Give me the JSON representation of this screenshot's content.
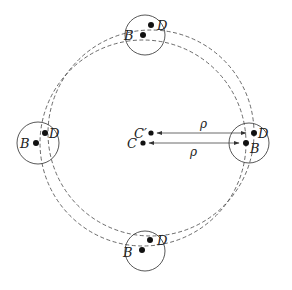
{
  "diagram": {
    "type": "geometric-orbit-diagram",
    "center_points": [
      {
        "id": "C",
        "label": "C",
        "x": 143,
        "y": 143
      },
      {
        "id": "Cprime",
        "label": "C′",
        "x": 151,
        "y": 133
      }
    ],
    "orbit_circles": [
      {
        "center": "C",
        "radius": 103,
        "style": "dashed"
      },
      {
        "center": "Cprime",
        "radius": 103,
        "style": "dashed"
      }
    ],
    "bodies": [
      {
        "position": "top",
        "circle": {
          "cx": 145,
          "cy": 35,
          "r": 20
        },
        "B": {
          "label": "B",
          "x": 143,
          "y": 35
        },
        "D": {
          "label": "D",
          "x": 151,
          "y": 25
        }
      },
      {
        "position": "left",
        "circle": {
          "cx": 38,
          "cy": 143,
          "r": 21
        },
        "B": {
          "label": "B",
          "x": 36,
          "y": 143
        },
        "D": {
          "label": "D",
          "x": 45,
          "y": 133
        }
      },
      {
        "position": "right",
        "circle": {
          "cx": 249,
          "cy": 143,
          "r": 20
        },
        "B": {
          "label": "B",
          "x": 246,
          "y": 143
        },
        "D": {
          "label": "D",
          "x": 254,
          "y": 133
        }
      },
      {
        "position": "bottom",
        "circle": {
          "cx": 145,
          "cy": 251,
          "r": 20
        },
        "B": {
          "label": "B",
          "x": 142,
          "y": 250
        },
        "D": {
          "label": "D",
          "x": 150,
          "y": 240
        }
      }
    ],
    "arrows": [
      {
        "from": "right.D",
        "to": "Cprime",
        "label": "ρ",
        "label_pos": "above"
      },
      {
        "from": "C",
        "to": "right.B",
        "label": "ρ",
        "label_pos": "below"
      }
    ],
    "labels": {
      "B": "B",
      "D": "D",
      "C": "C",
      "Cprime": "C′",
      "rho": "ρ"
    }
  }
}
